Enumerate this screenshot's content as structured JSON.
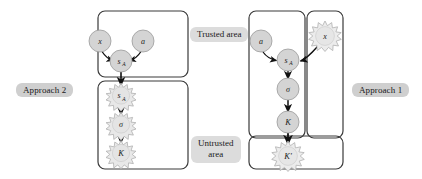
{
  "figure": {
    "type": "diagram",
    "width": 422,
    "height": 179,
    "background_color": "#ffffff",
    "colors": {
      "node_fill": "#d4d4d4",
      "node_stroke": "#9a9a9a",
      "spiky_fill": "#e8e8e8",
      "spiky_stroke": "#b0b0b0",
      "box_stroke": "#3a3a3a",
      "arrow": "#111111",
      "label_bg_approach": "#cfcfcf",
      "label_bg_area": "#dcdcdc",
      "text": "#1a1a1a"
    }
  },
  "labels": {
    "approach_2": "Approach 2",
    "approach_1": "Approach 1",
    "trusted_area": "Trusted area",
    "untrusted_area_line1": "Untrusted",
    "untrusted_area_line2": "area"
  },
  "approach_2": {
    "name": "Approach 2",
    "trusted_box": {
      "region": "trusted",
      "nodes": [
        {
          "id": "a2-a",
          "label": "a",
          "shape": "circle",
          "cx": 143,
          "cy": 41,
          "r": 11
        },
        {
          "id": "a2-x",
          "label": "x",
          "shape": "circle",
          "cx": 100,
          "cy": 41,
          "r": 11
        },
        {
          "id": "a2-sa",
          "label": "s",
          "sub": "A",
          "shape": "circle",
          "cx": 121,
          "cy": 61,
          "r": 11
        }
      ],
      "edges": [
        {
          "from": "a2-a",
          "to": "a2-sa",
          "style": "curved"
        },
        {
          "from": "a2-x",
          "to": "a2-sa",
          "style": "curved"
        }
      ]
    },
    "untrusted_box": {
      "region": "untrusted",
      "nodes": [
        {
          "id": "a2-sa2",
          "label": "s",
          "sub": "A",
          "shape": "spiky",
          "cx": 121,
          "cy": 95,
          "r": 11
        },
        {
          "id": "a2-sig",
          "label": "σ",
          "shape": "spiky",
          "cx": 121,
          "cy": 124,
          "r": 11
        },
        {
          "id": "a2-k",
          "label": "K",
          "shape": "spiky",
          "cx": 121,
          "cy": 152,
          "r": 11
        }
      ],
      "edges": [
        {
          "from": "a2-sa",
          "to": "a2-sa2",
          "style": "straight"
        },
        {
          "from": "a2-sa2",
          "to": "a2-sig",
          "style": "straight"
        },
        {
          "from": "a2-sig",
          "to": "a2-k",
          "style": "straight"
        }
      ]
    }
  },
  "approach_1": {
    "name": "Approach 1",
    "trusted_box": {
      "region": "trusted",
      "nodes": [
        {
          "id": "a1-a",
          "label": "a",
          "shape": "circle",
          "cx": 261,
          "cy": 41,
          "r": 11
        },
        {
          "id": "a1-sa",
          "label": "s",
          "sub": "A",
          "shape": "circle",
          "cx": 288,
          "cy": 60,
          "r": 11
        },
        {
          "id": "a1-sig",
          "label": "σ",
          "shape": "circle",
          "cx": 288,
          "cy": 89,
          "r": 11
        },
        {
          "id": "a1-k",
          "label": "K",
          "shape": "circle",
          "cx": 288,
          "cy": 122,
          "r": 11
        }
      ],
      "edges": [
        {
          "from": "a1-a",
          "to": "a1-sa",
          "style": "curved"
        },
        {
          "from": "a1-sa",
          "to": "a1-sig",
          "style": "straight"
        },
        {
          "from": "a1-sig",
          "to": "a1-k",
          "style": "straight"
        }
      ]
    },
    "untrusted_input_box": {
      "region": "untrusted",
      "nodes": [
        {
          "id": "a1-x",
          "label": "x",
          "shape": "spiky",
          "cx": 325,
          "cy": 35,
          "r": 12
        }
      ],
      "edges": [
        {
          "from": "a1-x",
          "to": "a1-sa",
          "style": "curved"
        }
      ]
    },
    "untrusted_output_box": {
      "region": "untrusted",
      "nodes": [
        {
          "id": "a1-kp",
          "label": "K′",
          "shape": "spiky",
          "cx": 288,
          "cy": 155,
          "r": 12
        }
      ],
      "edges": [
        {
          "from": "a1-k",
          "to": "a1-kp",
          "style": "straight"
        }
      ]
    }
  },
  "boxes": [
    {
      "id": "a2-trusted",
      "owner": "Approach 2",
      "region": "Trusted area",
      "x": 98,
      "y": 11,
      "w": 90,
      "h": 66
    },
    {
      "id": "a2-untrusted",
      "owner": "Approach 2",
      "region": "Untrusted area",
      "x": 98,
      "y": 81,
      "w": 90,
      "h": 88
    },
    {
      "id": "a1-trusted",
      "owner": "Approach 1",
      "region": "Trusted area",
      "x": 249,
      "y": 11,
      "w": 56,
      "h": 127
    },
    {
      "id": "a1-unt-in",
      "owner": "Approach 1",
      "region": "Untrusted area",
      "x": 307,
      "y": 11,
      "w": 36,
      "h": 127
    },
    {
      "id": "a1-unt-out",
      "owner": "Approach 1",
      "region": "Untrusted area",
      "x": 249,
      "y": 136,
      "w": 94,
      "h": 33
    }
  ]
}
